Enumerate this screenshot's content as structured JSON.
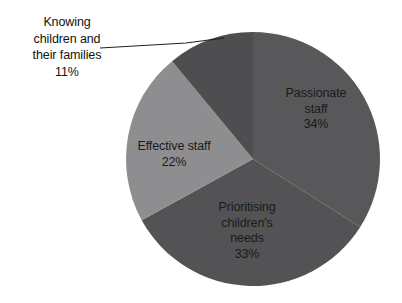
{
  "chart_data": {
    "type": "pie",
    "title": "",
    "subtitle": "",
    "xlabel": "",
    "ylabel": "",
    "legend_position": "none",
    "grid": false,
    "start_angle_deg": 0,
    "direction": "clockwise",
    "units": "percent",
    "categories": [
      "Passionate staff",
      "Prioritising children's needs",
      "Effective staff",
      "Knowing children and their families"
    ],
    "values": [
      34,
      33,
      22,
      11
    ],
    "labels_formatted": [
      "34%",
      "33%",
      "22%",
      "11%"
    ],
    "slices": [
      {
        "name": "Passionate staff",
        "value": 34,
        "value_label": "34%",
        "color": "#58585a",
        "label_placement": "inside",
        "label_lines": [
          "Passionate",
          "staff",
          "34%"
        ]
      },
      {
        "name": "Prioritising children's needs",
        "value": 33,
        "value_label": "33%",
        "color": "#535355",
        "label_placement": "inside",
        "label_lines": [
          "Prioritising",
          "children's",
          "needs",
          "33%"
        ]
      },
      {
        "name": "Effective staff",
        "value": 22,
        "value_label": "22%",
        "color": "#8e8e90",
        "label_placement": "inside",
        "label_lines": [
          "Effective staff",
          "22%"
        ]
      },
      {
        "name": "Knowing children and their families",
        "value": 11,
        "value_label": "11%",
        "color": "#4e4e50",
        "label_placement": "outside",
        "leader_line": true,
        "label_lines": [
          "Knowing",
          "children and",
          "their families",
          "11%"
        ]
      }
    ]
  },
  "labels": {
    "knowing": {
      "line1": "Knowing",
      "line2": "children and",
      "line3": "their families",
      "line4": "11%"
    },
    "passionate": {
      "line1": "Passionate",
      "line2": "staff",
      "line3": "34%"
    },
    "effective": {
      "line1": "Effective staff",
      "line2": "22%"
    },
    "prioritising": {
      "line1": "Prioritising",
      "line2": "children's",
      "line3": "needs",
      "line4": "33%"
    }
  },
  "colors": {
    "background": "#ffffff",
    "text": "#1a1a1a",
    "leader_line": "#1f1f1f",
    "slice_passionate": "#58585a",
    "slice_prioritising": "#535355",
    "slice_effective": "#8e8e90",
    "slice_knowing": "#4e4e50"
  }
}
